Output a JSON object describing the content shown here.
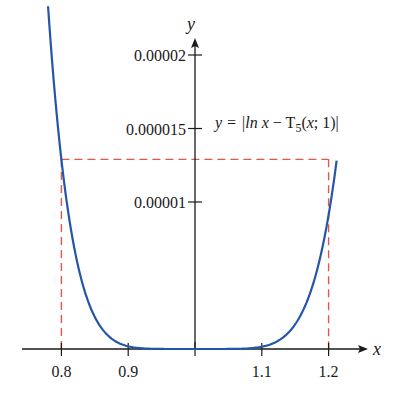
{
  "chart_data": {
    "type": "line",
    "title": "",
    "xlabel": "x",
    "ylabel": "y",
    "annotation": "y = |ln x − T5(x; 1)|",
    "annotation_parts": {
      "pre": "y = |ln ",
      "x1": "x",
      "mid": " − T",
      "sub": "5",
      "post_open": "(",
      "x2": "x",
      "post": "; 1)|"
    },
    "x_ticks": [
      0.8,
      0.9,
      1.1,
      1.2
    ],
    "x_tick_labels": [
      "0.8",
      "0.9",
      "1.1",
      "1.2"
    ],
    "y_ticks": [
      1e-05,
      1.5e-05,
      2e-05
    ],
    "y_tick_labels": [
      "0.00001",
      "0.000015",
      "0.00002"
    ],
    "xlim": [
      0.78,
      1.25
    ],
    "ylim": [
      0,
      2.15e-05
    ],
    "grid": false,
    "series": [
      {
        "name": "|ln x − T5(x; 1)|",
        "color": "#2456a8",
        "x": [
          0.78,
          0.8,
          0.82,
          0.85,
          0.9,
          0.95,
          1.0,
          1.05,
          1.1,
          1.15,
          1.2,
          1.212
        ],
        "values": [
          2.05e-05,
          1.29e-05,
          7.8e-06,
          3.4e-06,
          6.1e-07,
          1.5e-08,
          0,
          1.3e-08,
          4.9e-07,
          3.1e-06,
          1.05e-05,
          1.38e-05
        ]
      }
    ],
    "reference_box": {
      "color": "#e0584a",
      "x_left": 0.8,
      "x_right": 1.2,
      "y_top": 1.29e-05,
      "style": "dashed"
    }
  }
}
